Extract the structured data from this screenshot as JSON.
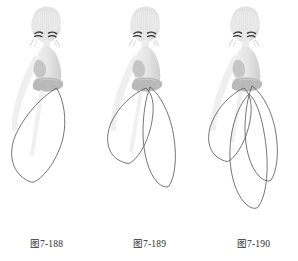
{
  "plate": {
    "title": "裙装造型图例 7-188 ~ 7-190",
    "background_color": "#ffffff",
    "ink_color": "#4a4a4a",
    "body_light": "#e9e9e9",
    "body_mid": "#d2d2d2",
    "body_shadow": "#b4b4b4",
    "hair_hatch": "#d8d8d8",
    "eye_color": "#3a3a3a"
  },
  "figures": [
    {
      "id": "figure-7-188",
      "caption": "图7-188",
      "petal_count": 1,
      "description": "单片花瓣形裙摆",
      "petals": [
        {
          "name": "center-petal",
          "lean": "center"
        }
      ]
    },
    {
      "id": "figure-7-189",
      "caption": "图7-189",
      "petal_count": 2,
      "description": "双片交叠花瓣形裙摆",
      "petals": [
        {
          "name": "left-petal",
          "lean": "left"
        },
        {
          "name": "right-petal",
          "lean": "right"
        }
      ]
    },
    {
      "id": "figure-7-190",
      "caption": "图7-190",
      "petal_count": 3,
      "description": "三片交叠花瓣形裙摆",
      "petals": [
        {
          "name": "left-petal",
          "lean": "left"
        },
        {
          "name": "right-petal",
          "lean": "right"
        },
        {
          "name": "center-petal",
          "lean": "center"
        }
      ]
    }
  ]
}
